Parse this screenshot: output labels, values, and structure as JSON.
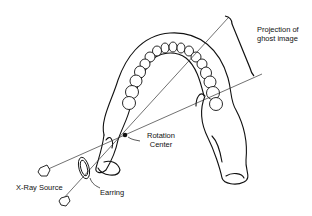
{
  "diagram": {
    "labels": {
      "projection": "Projection of ghost image",
      "rotation_center": "Rotation Center",
      "xray_source": "X-Ray Source",
      "earring": "Earring"
    },
    "elements": [
      "mandible",
      "teeth-arch",
      "x-ray-source-1",
      "x-ray-source-2",
      "earring",
      "rotation-center-point",
      "projection-bracket",
      "beam-lines"
    ],
    "colors": {
      "line": "#111111",
      "background": "#ffffff"
    }
  }
}
